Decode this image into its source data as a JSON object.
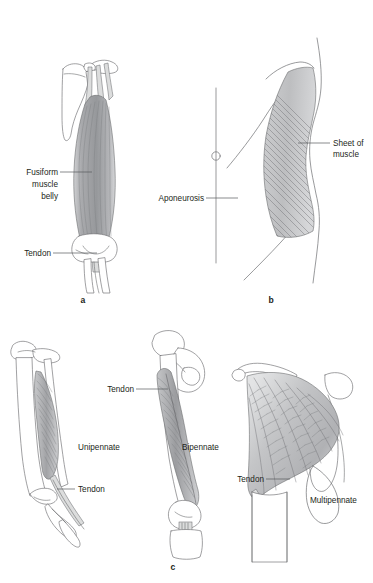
{
  "figure": {
    "background_color": "#ffffff",
    "line_color": "#6d6e71",
    "text_color": "#231f20",
    "muscle_fill": "#b9babc",
    "tendon_fill": "#dcdddd"
  },
  "panels": [
    {
      "id": "a",
      "letter": "a",
      "name": "fusiform-muscle-panel"
    },
    {
      "id": "b",
      "letter": "b",
      "name": "aponeurosis-panel"
    },
    {
      "id": "c",
      "letter": "c",
      "name": "pennate-muscle-panel"
    }
  ],
  "labels": {
    "fusiform_line1": "Fusiform",
    "fusiform_line2": "muscle",
    "fusiform_line3": "belly",
    "tendon_a": "Tendon",
    "aponeurosis": "Aponeurosis",
    "sheet_line1": "Sheet of",
    "sheet_line2": "muscle",
    "unipennate": "Unipennate",
    "tendon_unipennate": "Tendon",
    "tendon_bipennate": "Tendon",
    "bipennate": "Bipennate",
    "tendon_multipennate": "Tendon",
    "multipennate": "Multipennate"
  }
}
